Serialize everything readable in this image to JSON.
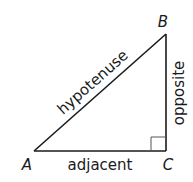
{
  "diagram": {
    "vertices": {
      "A": "A",
      "B": "B",
      "C": "C"
    },
    "sides": {
      "hypotenuse": "hypotenuse",
      "opposite": "opposite",
      "adjacent": "adjacent"
    },
    "right_angle_at": "C",
    "colors": {
      "stroke": "#1a1a1a",
      "right_angle_marker": "#555555",
      "background": "#ffffff"
    }
  }
}
